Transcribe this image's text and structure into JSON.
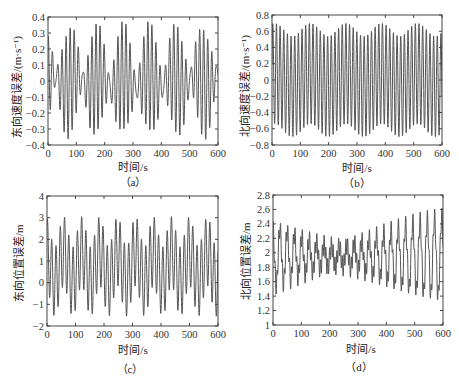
{
  "chart_data": [
    {
      "id": "a",
      "type": "line",
      "caption": "（a）",
      "title": "",
      "xlabel": "时间/s",
      "ylabel": "东向速度误差/(m·s⁻¹)",
      "xlim": [
        0,
        600
      ],
      "ylim": [
        -0.4,
        0.4
      ],
      "xticks": [
        0,
        100,
        200,
        300,
        400,
        500,
        600
      ],
      "yticks": [
        -0.4,
        -0.3,
        -0.2,
        -0.1,
        0,
        0.1,
        0.2,
        0.3,
        0.4
      ],
      "ytick_labels": [
        "-0.4",
        "-0.3",
        "-0.2",
        "-0.1",
        "0",
        "0.1",
        "0.2",
        "0.3",
        "0.4"
      ],
      "grid": false,
      "line_color": "#555555",
      "model": {
        "offset": 0,
        "components": [
          {
            "amp": 0.2,
            "period": 15.2,
            "phase": 0.6
          },
          {
            "amp": 0.14,
            "period": 13.1,
            "phase": 1.9
          },
          {
            "amp": 0.04,
            "period": 84.0,
            "phase": 0.3
          }
        ]
      },
      "x": [
        0,
        50,
        100,
        150,
        200,
        250,
        300,
        350,
        400,
        450,
        500,
        550,
        600
      ],
      "y": [
        0.05,
        -0.1,
        -0.35,
        0.3,
        -0.05,
        0.2,
        -0.1,
        0.25,
        -0.3,
        0.05,
        0.3,
        -0.35,
        0.2
      ],
      "approx_amplitude": 0.36,
      "approx_period_s": 14
    },
    {
      "id": "b",
      "type": "line",
      "caption": "（b）",
      "title": "",
      "xlabel": "时间/s",
      "ylabel": "北向速度误差/(m·s⁻¹)",
      "xlim": [
        0,
        600
      ],
      "ylim": [
        -0.8,
        0.8
      ],
      "xticks": [
        0,
        100,
        200,
        300,
        400,
        500,
        600
      ],
      "yticks": [
        -0.8,
        -0.6,
        -0.4,
        -0.2,
        0,
        0.2,
        0.4,
        0.6,
        0.8
      ],
      "ytick_labels": [
        "-0.8",
        "-0.6",
        "-0.4",
        "-0.2",
        "0",
        "0.2",
        "0.4",
        "0.6",
        "0.8"
      ],
      "grid": false,
      "line_color": "#555555",
      "model": {
        "offset": 0,
        "components": [
          {
            "amp": 0.62,
            "period": 12.9,
            "phase": 0.2
          },
          {
            "amp": 0.08,
            "period": 126.0,
            "phase": 1.1
          }
        ]
      },
      "x": [
        0,
        50,
        100,
        150,
        200,
        250,
        300,
        350,
        400,
        450,
        500,
        550,
        600
      ],
      "y": [
        0.5,
        -0.6,
        0.65,
        -0.55,
        0.6,
        -0.7,
        0.7,
        -0.6,
        0.62,
        -0.6,
        0.62,
        -0.7,
        0.6
      ],
      "approx_amplitude": 0.7,
      "approx_period_s": 13
    },
    {
      "id": "c",
      "type": "line",
      "caption": "（c）",
      "title": "",
      "xlabel": "时间/s",
      "ylabel": "东向位置误差/m",
      "xlim": [
        0,
        600
      ],
      "ylim": [
        -2,
        4
      ],
      "xticks": [
        0,
        100,
        200,
        300,
        400,
        500,
        600
      ],
      "yticks": [
        -2,
        -1,
        0,
        1,
        2,
        3,
        4
      ],
      "ytick_labels": [
        "-2",
        "-1",
        "0",
        "1",
        "2",
        "3",
        "4"
      ],
      "grid": false,
      "line_color": "#555555",
      "model": {
        "offset": 0.75,
        "components": [
          {
            "amp": 1.6,
            "period": 15.0,
            "phase": 0.9
          },
          {
            "amp": 0.7,
            "period": 63.0,
            "phase": 2.0
          }
        ]
      },
      "x": [
        0,
        50,
        100,
        150,
        200,
        250,
        300,
        350,
        400,
        450,
        500,
        550,
        600
      ],
      "y": [
        2.2,
        -1.5,
        3.0,
        -1.2,
        2.8,
        -1.5,
        3.0,
        -1.4,
        2.5,
        3.0,
        -1.5,
        2.7,
        -1.0
      ],
      "approx_amplitude": 2.25,
      "approx_period_s": 15
    },
    {
      "id": "d",
      "type": "line",
      "caption": "（d）",
      "title": "",
      "xlabel": "时间/s",
      "ylabel": "北向位置误差/m",
      "xlim": [
        0,
        600
      ],
      "ylim": [
        1,
        2.8
      ],
      "xticks": [
        0,
        100,
        200,
        300,
        400,
        500,
        600
      ],
      "yticks": [
        1,
        1.2,
        1.4,
        1.6,
        1.8,
        2,
        2.2,
        2.4,
        2.6,
        2.8
      ],
      "ytick_labels": [
        "1",
        "1.2",
        "1.4",
        "1.6",
        "1.8",
        "2",
        "2.2",
        "2.4",
        "2.6",
        "2.8"
      ],
      "grid": false,
      "line_color": "#555555",
      "model": {
        "offset": 1.95,
        "components": [
          {
            "amp": 0.13,
            "period": 6.4,
            "phase": 0.4
          },
          {
            "amp": 0.36,
            "period": 25.8,
            "phase": 1.3
          },
          {
            "amp": 0.22,
            "period": 25.1,
            "phase": 2.9
          }
        ]
      },
      "x": [
        0,
        50,
        100,
        150,
        200,
        250,
        300,
        350,
        400,
        450,
        500,
        550,
        600
      ],
      "y": [
        2.5,
        1.6,
        1.05,
        2.6,
        2.75,
        2.65,
        1.0,
        1.2,
        1.5,
        2.5,
        2.75,
        1.05,
        2.0
      ],
      "approx_center": 2.0,
      "approx_period_s": 26
    }
  ],
  "figure": {
    "panels": [
      "a",
      "b",
      "c",
      "d"
    ],
    "layout": "2x2",
    "background": "#ffffff"
  }
}
